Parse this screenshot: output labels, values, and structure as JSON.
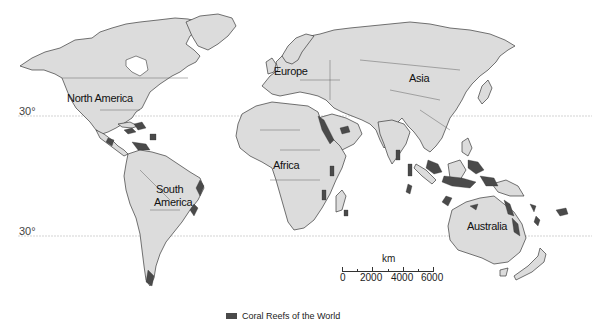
{
  "map": {
    "continent_labels": {
      "north_america": "North America",
      "south_america": "South\nAmerica",
      "south_america_line1": "South",
      "south_america_line2": "America",
      "europe": "Europe",
      "africa": "Africa",
      "asia": "Asia",
      "australia": "Australia"
    },
    "latitude_lines": [
      {
        "label": "30°",
        "position": "north"
      },
      {
        "label": "30°",
        "position": "south"
      }
    ],
    "scale": {
      "unit": "km",
      "ticks": [
        "0",
        "2000",
        "4000",
        "6000"
      ]
    },
    "legend": {
      "label": "Coral Reefs of the World",
      "swatch_color": "#4a4a4a"
    },
    "colors": {
      "land": "#dcdcdc",
      "outline": "#3a3a3a",
      "reef": "#4a4a4a",
      "background": "#ffffff"
    }
  }
}
